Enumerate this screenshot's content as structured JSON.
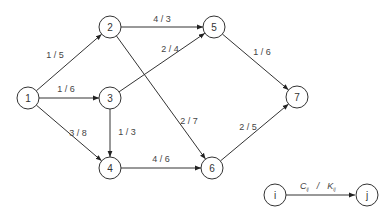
{
  "diagram": {
    "type": "network-graph",
    "nodes": [
      {
        "id": "1",
        "label": "1",
        "x": 28,
        "y": 98
      },
      {
        "id": "2",
        "label": "2",
        "x": 110,
        "y": 27
      },
      {
        "id": "3",
        "label": "3",
        "x": 110,
        "y": 98
      },
      {
        "id": "4",
        "label": "4",
        "x": 110,
        "y": 168
      },
      {
        "id": "5",
        "label": "5",
        "x": 214,
        "y": 27
      },
      {
        "id": "6",
        "label": "6",
        "x": 212,
        "y": 168
      },
      {
        "id": "7",
        "label": "7",
        "x": 297,
        "y": 97
      }
    ],
    "edges": [
      {
        "from": "1",
        "to": "2",
        "label": "1 / 5",
        "lx": 55,
        "ly": 58
      },
      {
        "from": "1",
        "to": "3",
        "label": "1 / 6",
        "lx": 66,
        "ly": 92
      },
      {
        "from": "1",
        "to": "4",
        "label": "3 / 8",
        "lx": 78,
        "ly": 136
      },
      {
        "from": "2",
        "to": "5",
        "label": "4 / 3",
        "lx": 162,
        "ly": 22
      },
      {
        "from": "2",
        "to": "6",
        "label": "2 / 7",
        "lx": 189,
        "ly": 124
      },
      {
        "from": "3",
        "to": "5",
        "label": "2 / 4",
        "lx": 170,
        "ly": 52
      },
      {
        "from": "3",
        "to": "4",
        "label": "1 / 3",
        "lx": 127,
        "ly": 135
      },
      {
        "from": "4",
        "to": "6",
        "label": "4 / 6",
        "lx": 161,
        "ly": 162
      },
      {
        "from": "5",
        "to": "7",
        "label": "1 / 6",
        "lx": 262,
        "ly": 55
      },
      {
        "from": "6",
        "to": "7",
        "label": "2 / 5",
        "lx": 248,
        "ly": 130
      }
    ]
  },
  "legend": {
    "from_label": "i",
    "to_label": "j",
    "edge_label_c": "C",
    "edge_label_c_sub": "ij",
    "separator": "/",
    "edge_label_k": "K",
    "edge_label_k_sub": "ij"
  }
}
